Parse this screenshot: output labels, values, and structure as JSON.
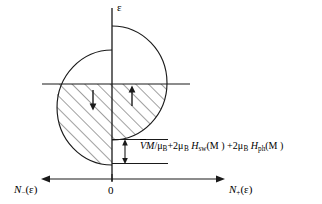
{
  "figure": {
    "kind": "density-of-states-band-diagram",
    "axes": {
      "vertical_label": "ε",
      "origin_label": "0",
      "left_axis_label_prefix": "N",
      "left_axis_label_sub": "−",
      "left_axis_label_suffix": "(ε)",
      "right_axis_label_prefix": "N",
      "right_axis_label_sub": "+",
      "right_axis_label_suffix": "(ε)",
      "left_axis_label_full": "N−(ε)",
      "right_axis_label_full": "N+(ε)"
    },
    "annotation": {
      "splitting_formula_full": "ṼM/μB + 2μB Hsw(M) + 2μB Hph(M)",
      "terms": [
        {
          "coef": "",
          "numer": "ṼM",
          "denom": "μ",
          "denom_sub": "B"
        },
        {
          "coef": "2",
          "symbol": "μ",
          "symbol_sub": "B",
          "field": "H",
          "field_sub": "sw",
          "arg": "(M)"
        },
        {
          "coef": "2",
          "symbol": "μ",
          "symbol_sub": "B",
          "field": "H",
          "field_sub": "ph",
          "arg": "(M)"
        }
      ],
      "pieces": {
        "v_tilde": "V",
        "m_1": "M",
        "slash": "/",
        "mu_1": "μ",
        "mu_1_sub": "B",
        "plus_1": "+2",
        "mu_2": "μ",
        "mu_2_sub": "B",
        "h_1": "H",
        "h_1_sub": "sw",
        "arg_1": "(M )",
        "plus_2": "+2",
        "mu_3": "μ",
        "mu_3_sub": "B",
        "h_2": "H",
        "h_2_sub": "ph",
        "arg_2": "(M )"
      }
    },
    "spin_arrows": {
      "minority_label": "↓",
      "majority_label": "↑",
      "minority_side": "left",
      "majority_side": "right"
    },
    "colors": {
      "stroke": "#1a1a1a",
      "hatch": "#2b2b2b",
      "background": "#ffffff"
    }
  }
}
